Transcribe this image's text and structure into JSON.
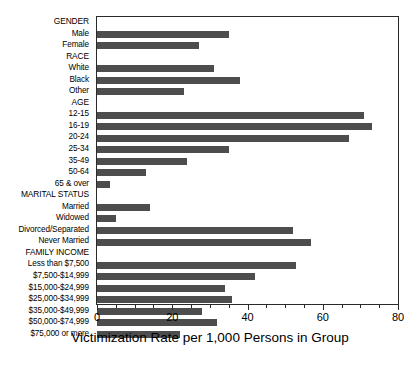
{
  "chart_data": {
    "type": "bar",
    "orientation": "horizontal",
    "title": "",
    "xlabel": "Victimization Rate per 1,000 Persons in Group",
    "ylabel": "",
    "xlim": [
      0,
      80
    ],
    "xticks": [
      0,
      20,
      40,
      60,
      80
    ],
    "xtick_labels": [
      "0",
      "20",
      "40",
      "60",
      "80"
    ],
    "minor_tick_interval": 5,
    "grid": false,
    "legend": false,
    "bar_color": "#4d4d4d",
    "categories": [
      "GENDER",
      "Male",
      "Female",
      "RACE",
      "White",
      "Black",
      "Other",
      "AGE",
      "12-15",
      "16-19",
      "20-24",
      "25-34",
      "35-49",
      "50-64",
      "65 & over",
      "MARITAL STATUS",
      "Married",
      "Widowed",
      "Divorced/Separated",
      "Never Married",
      "FAMILY INCOME",
      "Less than $7,500",
      "$7,500-$14,999",
      "$15,000-$24,999",
      "$25,000-$34,999",
      "$35,000-$49,999",
      "$50,000-$74,999",
      "$75,000 or more"
    ],
    "is_heading": [
      true,
      false,
      false,
      true,
      false,
      false,
      false,
      true,
      false,
      false,
      false,
      false,
      false,
      false,
      false,
      true,
      false,
      false,
      false,
      false,
      true,
      false,
      false,
      false,
      false,
      false,
      false,
      false
    ],
    "values": [
      null,
      35,
      27,
      null,
      31,
      38,
      23,
      null,
      71,
      73,
      67,
      35,
      24,
      13,
      3.5,
      null,
      14,
      5,
      52,
      57,
      null,
      53,
      42,
      34,
      36,
      28,
      32,
      22
    ]
  }
}
